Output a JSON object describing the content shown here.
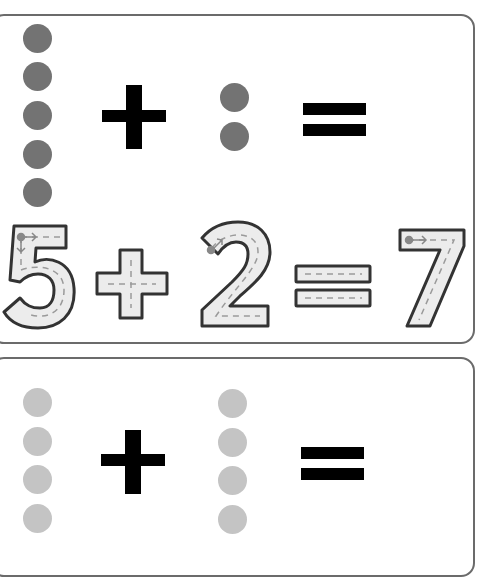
{
  "worksheet": {
    "problems": [
      {
        "addend1": 5,
        "addend2": 2,
        "sum": 7,
        "dot_color": "#737373",
        "operator_plus": "+",
        "operator_equals": "=",
        "tracing_equation": "5+2=7"
      },
      {
        "addend1": 4,
        "addend2": 4,
        "sum": null,
        "dot_color": "#c4c4c4",
        "operator_plus": "+",
        "operator_equals": "="
      }
    ],
    "trace_fill": "#ececec",
    "trace_stroke": "#333333"
  }
}
